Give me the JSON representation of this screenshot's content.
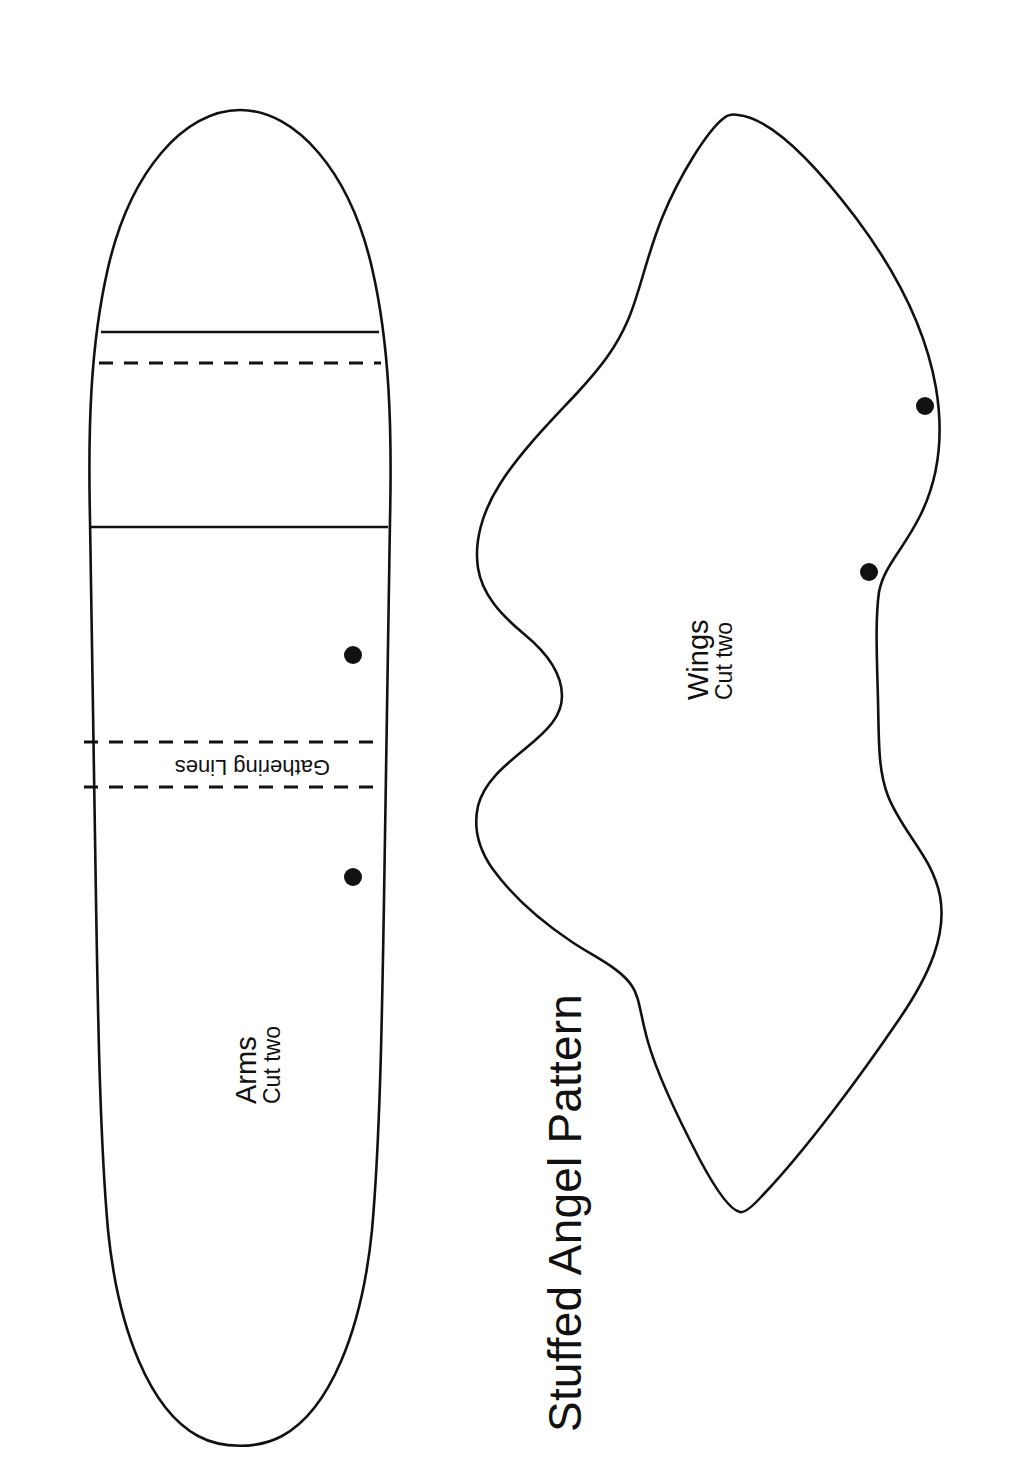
{
  "document": {
    "title": "Stuffed Angel Pattern",
    "background_color": "#ffffff",
    "ink_color": "#111111",
    "page_width": 1030,
    "page_height": 1483
  },
  "title_block": {
    "text": "Stuffed Angel Pattern",
    "rotation_deg": -90
  },
  "pieces": [
    {
      "id": "arms",
      "name": "Arms",
      "quantity_note": "Cut two",
      "rotation_deg": -90,
      "marker_dots": 2,
      "solid_fold_lines": 2,
      "dashed_lines": 3
    },
    {
      "id": "wings",
      "name": "Wings",
      "quantity_note": "Cut two",
      "rotation_deg": -90,
      "marker_dots": 2,
      "solid_fold_lines": 0,
      "dashed_lines": 0
    }
  ],
  "annotations": {
    "gathering_lines_label": "Gathering Lines",
    "gathering_lines_rotation_deg": 180
  },
  "line_styles": {
    "outline": "solid",
    "gathering": "dashed",
    "fold": "solid"
  }
}
